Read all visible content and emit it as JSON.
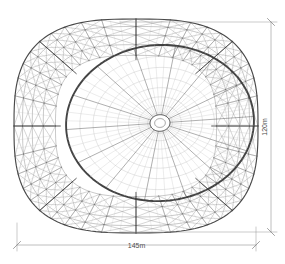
{
  "figure": {
    "caption": "",
    "background_color": "#ffffff",
    "line_color": "#3a3a3a",
    "light_line_color": "#b9b9b9",
    "dimension_color": "#8a8a8a",
    "dimension_text_color": "#4a4a4a"
  },
  "dimensions": {
    "horizontal": {
      "label": "145m",
      "name": "span-width",
      "orientation": "horizontal",
      "value": 145,
      "unit": "m",
      "line_y": 245,
      "x_start": 17,
      "x_end": 256
    },
    "vertical": {
      "label": "120m",
      "name": "span-depth",
      "orientation": "vertical",
      "value": 120,
      "unit": "m",
      "line_x": 271,
      "y_start": 22,
      "y_end": 232
    }
  },
  "geometry": {
    "outer_shell": {
      "cx": 136,
      "cy": 126,
      "rx": 122,
      "ry": 107,
      "squareness": 0.62,
      "radial_segments": 40,
      "ring_count": 5,
      "diagrid": true
    },
    "inner_dome": {
      "cx": 160,
      "cy": 123,
      "rx": 94,
      "ry": 78,
      "rotation_deg": -4,
      "radial_ribs": 56,
      "concentric_rings": 9,
      "oculus_rx": 10,
      "oculus_ry": 8
    }
  },
  "chart_data": {
    "type": "diagram",
    "annotations": [
      "145m",
      "120m"
    ]
  }
}
